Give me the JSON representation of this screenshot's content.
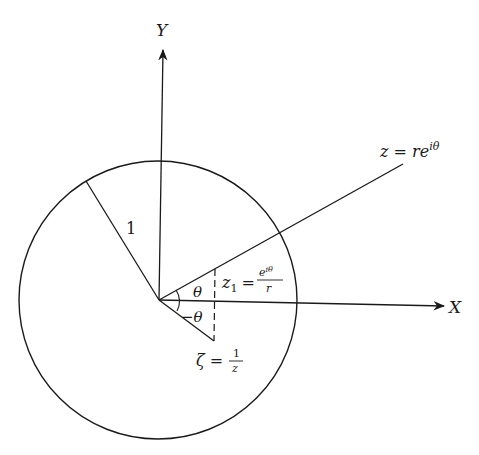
{
  "diagram": {
    "type": "complex-plane inversion diagram",
    "axes": {
      "x_label": "X",
      "y_label": "Y"
    },
    "unit_circle": {
      "radius_label": "1"
    },
    "labels": {
      "z_main": "z = re",
      "z_sup": "iθ",
      "z1_lhs": "z",
      "z1_sub": "1",
      "z1_eq": "=",
      "z1_num": "e",
      "z1_num_sup": "iθ",
      "z1_den": "r",
      "theta": "θ",
      "neg_theta": "−θ",
      "zeta_lhs": "ζ =",
      "zeta_num": "1",
      "zeta_den": "z"
    },
    "colors": {
      "ink": "#1a1a1a",
      "background": "#ffffff"
    }
  }
}
